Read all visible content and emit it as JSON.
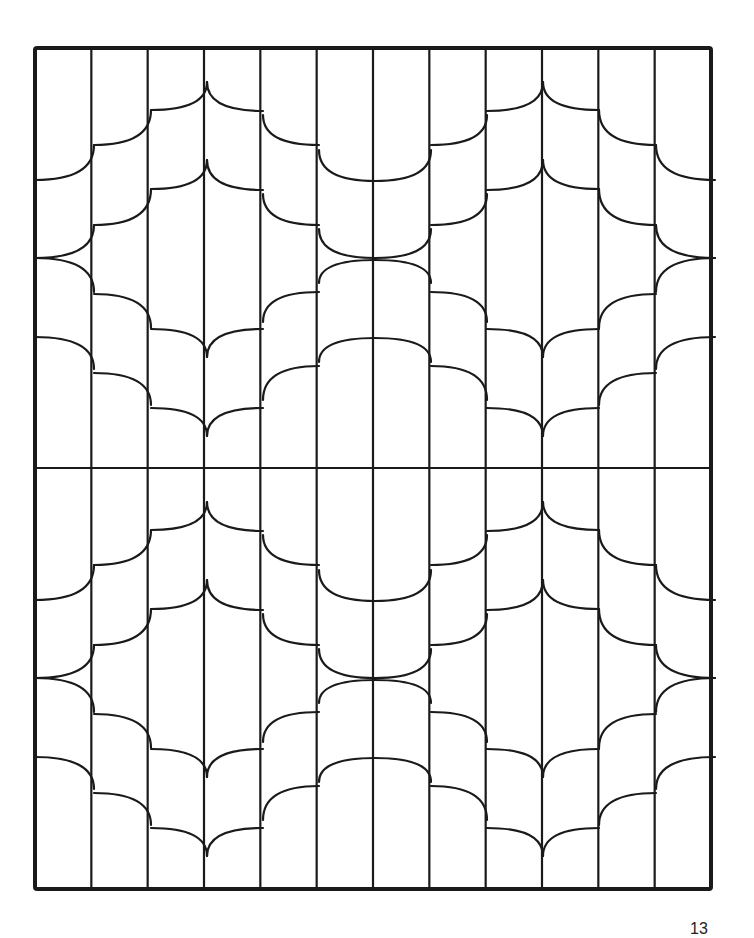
{
  "page": {
    "page_number": "13",
    "colors": {
      "line": "#1a1a1a",
      "background": "#ffffff"
    }
  },
  "frame": {
    "x": 35,
    "y": 48,
    "width": 676,
    "height": 841,
    "stroke_width": 4
  },
  "grid": {
    "columns": 12,
    "midline_y": 468,
    "line_width": 2.2
  },
  "pattern": {
    "half_offsets": [
      0,
      420
    ],
    "mirror_x": 375,
    "segments_left_half": [
      [
        [
          207,
          82
        ],
        [
          207,
          110
        ],
        [
          151,
          110
        ]
      ],
      [
        [
          151,
          110
        ],
        [
          151,
          145
        ],
        [
          94,
          145
        ]
      ],
      [
        [
          94,
          145
        ],
        [
          94,
          180
        ],
        [
          35,
          180
        ]
      ],
      [
        [
          207,
          82
        ],
        [
          207,
          111
        ],
        [
          263,
          111
        ]
      ],
      [
        [
          263,
          115
        ],
        [
          263,
          145
        ],
        [
          319,
          145
        ]
      ],
      [
        [
          319,
          150
        ],
        [
          319,
          181
        ],
        [
          375,
          181
        ]
      ],
      [
        [
          207,
          160
        ],
        [
          207,
          189
        ],
        [
          151,
          189
        ]
      ],
      [
        [
          151,
          189
        ],
        [
          151,
          225
        ],
        [
          94,
          225
        ]
      ],
      [
        [
          94,
          225
        ],
        [
          94,
          258
        ],
        [
          35,
          258
        ]
      ],
      [
        [
          207,
          160
        ],
        [
          207,
          190
        ],
        [
          263,
          190
        ]
      ],
      [
        [
          263,
          194
        ],
        [
          263,
          225
        ],
        [
          319,
          225
        ]
      ],
      [
        [
          319,
          229
        ],
        [
          319,
          258
        ],
        [
          375,
          258
        ]
      ],
      [
        [
          35,
          258
        ],
        [
          94,
          258
        ],
        [
          94,
          292
        ]
      ],
      [
        [
          94,
          294
        ],
        [
          151,
          294
        ],
        [
          151,
          328
        ]
      ],
      [
        [
          151,
          329
        ],
        [
          207,
          329
        ],
        [
          207,
          357
        ]
      ],
      [
        [
          207,
          357
        ],
        [
          207,
          329
        ],
        [
          263,
          329
        ]
      ],
      [
        [
          263,
          322
        ],
        [
          263,
          292
        ],
        [
          319,
          292
        ]
      ],
      [
        [
          319,
          283
        ],
        [
          319,
          260
        ],
        [
          375,
          260
        ]
      ],
      [
        [
          35,
          337
        ],
        [
          94,
          337
        ],
        [
          94,
          369
        ]
      ],
      [
        [
          94,
          373
        ],
        [
          151,
          373
        ],
        [
          151,
          405
        ]
      ],
      [
        [
          151,
          408
        ],
        [
          207,
          408
        ],
        [
          207,
          436
        ]
      ],
      [
        [
          207,
          436
        ],
        [
          207,
          408
        ],
        [
          263,
          408
        ]
      ],
      [
        [
          263,
          400
        ],
        [
          263,
          366
        ],
        [
          319,
          366
        ]
      ],
      [
        [
          319,
          362
        ],
        [
          319,
          338
        ],
        [
          375,
          338
        ]
      ]
    ]
  }
}
